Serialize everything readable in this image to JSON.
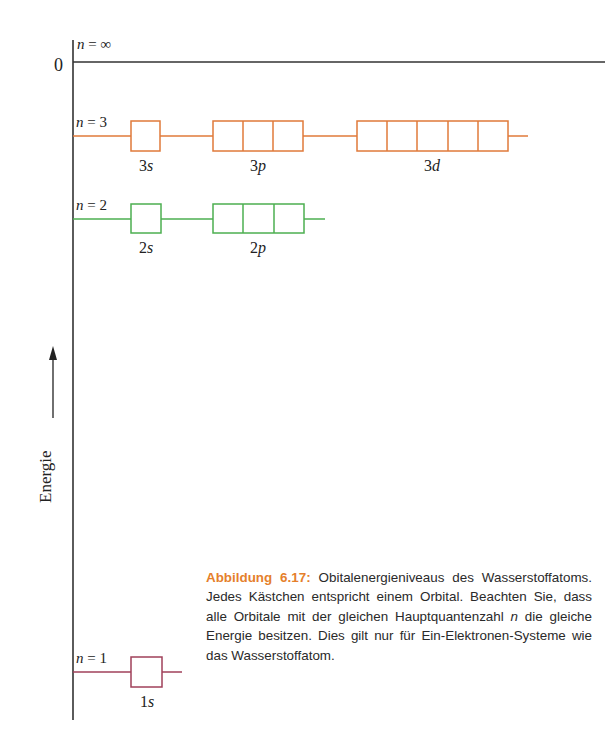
{
  "diagram": {
    "axis": {
      "label": "Energie",
      "zero_label": "0"
    },
    "levels": [
      {
        "id": "ninf",
        "label_var": "n",
        "label_eq": " = ",
        "label_val": "∞",
        "color": "#333333",
        "orbitals": []
      },
      {
        "id": "n3",
        "label_var": "n",
        "label_eq": " = ",
        "label_val": "3",
        "color": "#e07a3a",
        "orbitals": [
          {
            "name": "3s",
            "n": "3",
            "l": "s",
            "boxes": 1
          },
          {
            "name": "3p",
            "n": "3",
            "l": "p",
            "boxes": 3
          },
          {
            "name": "3d",
            "n": "3",
            "l": "d",
            "boxes": 5
          }
        ]
      },
      {
        "id": "n2",
        "label_var": "n",
        "label_eq": " = ",
        "label_val": "2",
        "color": "#4caf50",
        "orbitals": [
          {
            "name": "2s",
            "n": "2",
            "l": "s",
            "boxes": 1
          },
          {
            "name": "2p",
            "n": "2",
            "l": "p",
            "boxes": 3
          }
        ]
      },
      {
        "id": "n1",
        "label_var": "n",
        "label_eq": " = ",
        "label_val": "1",
        "color": "#a0405a",
        "orbitals": [
          {
            "name": "1s",
            "n": "1",
            "l": "s",
            "boxes": 1
          }
        ]
      }
    ]
  },
  "caption": {
    "figure_label": "Abbildung 6.17:",
    "text_1": " Obitalenergieniveaus des Wasserstoffatoms. Jedes Kästchen entspricht einem Orbital. Beachten Sie, dass alle Orbitale mit der gleichen Hauptquantenzahl ",
    "italic_n": "n",
    "text_2": " die gleiche Energie besitzen. Dies gilt nur für Ein-Elektronen-Systeme wie das Wasserstoffatom.",
    "accent_color": "#e57f2c"
  }
}
